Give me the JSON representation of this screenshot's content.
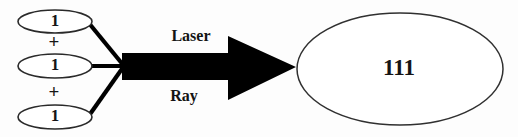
{
  "diagram": {
    "type": "equation-illustration",
    "background_color": "#fdfdfd",
    "stroke_color": "#2a2a2a",
    "arrow_color": "#000000",
    "operands": [
      {
        "value": "1"
      },
      {
        "value": "1"
      },
      {
        "value": "1"
      }
    ],
    "operators": [
      {
        "symbol": "+"
      },
      {
        "symbol": "+"
      }
    ],
    "arrow": {
      "direction": "right",
      "label_top": "Laser",
      "label_bottom": "Ray",
      "color": "#000000"
    },
    "result": {
      "value": "111"
    }
  }
}
